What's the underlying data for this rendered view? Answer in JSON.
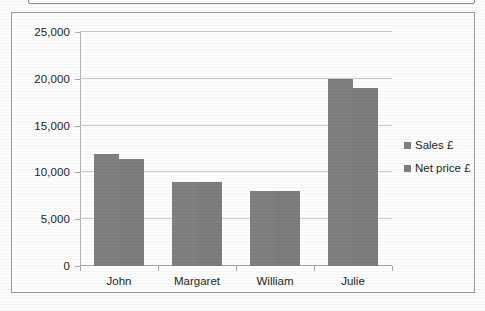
{
  "chart_data": {
    "type": "bar",
    "title": "",
    "xlabel": "",
    "ylabel": "",
    "categories": [
      "John",
      "Margaret",
      "William",
      "Julie"
    ],
    "series": [
      {
        "name": "Sales £",
        "values": [
          12000,
          9000,
          8000,
          20000
        ],
        "color": "#808080"
      },
      {
        "name": "Net price £",
        "values": [
          11400,
          9000,
          8000,
          19000
        ],
        "color": "#7d7d7d"
      }
    ],
    "ylim": [
      0,
      25000
    ],
    "yticks": [
      0,
      5000,
      10000,
      15000,
      20000,
      25000
    ],
    "ytick_labels": [
      "0",
      "5,000",
      "10,000",
      "15,000",
      "20,000",
      "25,000"
    ],
    "grid": true,
    "legend_position": "right"
  },
  "legend": {
    "items": [
      {
        "label": "Sales £"
      },
      {
        "label": "Net price £"
      }
    ]
  }
}
